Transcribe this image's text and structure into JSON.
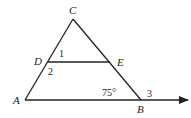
{
  "diagram": {
    "type": "triangle with parallel segment",
    "points": {
      "C": {
        "label": "C",
        "x": 73,
        "y": 19
      },
      "D": {
        "label": "D",
        "x": 48,
        "y": 62
      },
      "E": {
        "label": "E",
        "x": 110,
        "y": 62
      },
      "A": {
        "label": "A",
        "x": 25,
        "y": 100
      },
      "B": {
        "label": "B",
        "x": 141,
        "y": 100
      }
    },
    "angles": {
      "angle1": "1",
      "angle2": "2",
      "angle3": "3",
      "angleB": "75°"
    },
    "colors": {
      "stroke": "#222222",
      "background": "#ffffff"
    }
  }
}
